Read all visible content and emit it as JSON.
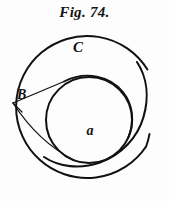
{
  "figure": {
    "caption": "Fig. 74.",
    "background_color": "#fdfdfd",
    "ink_color": "#111111",
    "width": 169,
    "height": 201
  },
  "labels": {
    "outer_circle": "C",
    "inner_circle": "a",
    "vertex_point": "B"
  },
  "label_positions": {
    "outer_circle": {
      "x": 78,
      "y": 52
    },
    "inner_circle": {
      "x": 90,
      "y": 135
    },
    "vertex_point": {
      "x": 17,
      "y": 99
    }
  },
  "geometry": {
    "outer_circle": {
      "cx": 84,
      "cy": 107,
      "r": 71,
      "gap_start_deg": -62,
      "gap_end_deg": -35,
      "stroke_width": 2.0
    },
    "inner_circle": {
      "cx": 89,
      "cy": 120,
      "r": 43,
      "stroke_width": 2.0
    },
    "spiral_arc": {
      "description": "eccentric involute arc sweeping from upper-right inward to lower-left",
      "stroke_width": 2.0
    },
    "vertex": {
      "x": 13,
      "y": 103
    },
    "tangent_lines": [
      {
        "from": {
          "x": 13,
          "y": 103
        },
        "to": {
          "x": 64,
          "y": 81
        }
      },
      {
        "from": {
          "x": 13,
          "y": 103
        },
        "to": {
          "x": 72,
          "y": 161
        }
      }
    ]
  }
}
